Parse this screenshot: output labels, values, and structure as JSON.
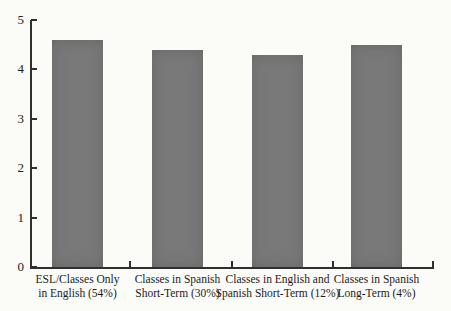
{
  "chart_data": {
    "type": "bar",
    "title": "",
    "xlabel": "",
    "ylabel": "",
    "categories": [
      "ESL/Classes Only in English (54%)",
      "Classes in Spanish Short-Term (30%)",
      "Classes in English and Spanish Short-Term (12%)",
      "Classes in Spanish Long-Term (4%)"
    ],
    "category_lines": [
      [
        "ESL/Classes Only",
        "in English (54%)"
      ],
      [
        "Classes in Spanish",
        "Short-Term (30%)"
      ],
      [
        "Classes in English and",
        "Spanish Short-Term (12%)"
      ],
      [
        "Classes in Spanish",
        "Long-Term (4%)"
      ]
    ],
    "values": [
      4.6,
      4.4,
      4.3,
      4.5
    ],
    "ylim": [
      0,
      5
    ],
    "yticks": [
      0,
      1,
      2,
      3,
      4,
      5
    ],
    "grid": "off",
    "legend": "none",
    "bar_color": "#797979",
    "axis_color": "#2f2f2f",
    "text_color": "#1c1c1c",
    "background_color": "#fbfbf8"
  }
}
